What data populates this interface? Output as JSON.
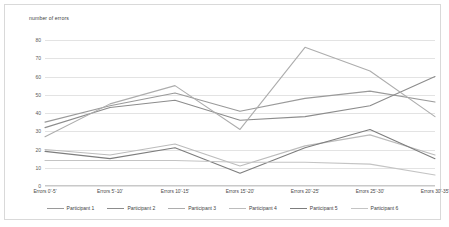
{
  "chart_data": {
    "type": "line",
    "title": "",
    "axis_title": "number of errors",
    "xlabel": "",
    "ylabel": "number of errors",
    "ylim": [
      0,
      80
    ],
    "yticks": [
      0,
      10,
      20,
      30,
      40,
      50,
      60,
      70,
      80
    ],
    "grid": true,
    "legend_position": "bottom",
    "categories": [
      "Errors 0'-5'",
      "Errors 5'-10'",
      "Errors 10'-15'",
      "Errors 15'-20'",
      "Errors 20'-25'",
      "Errors 25'-30'",
      "Errors 30'-35'"
    ],
    "series": [
      {
        "name": "Participant 1",
        "color": "#9a9a9a",
        "values": [
          35,
          44,
          51,
          41,
          48,
          52,
          46
        ]
      },
      {
        "name": "Participant 2",
        "color": "#8c8c8c",
        "values": [
          32,
          43,
          47,
          36,
          38,
          44,
          60
        ]
      },
      {
        "name": "Participant 3",
        "color": "#adadad",
        "values": [
          27,
          45,
          55,
          31,
          76,
          63,
          38
        ]
      },
      {
        "name": "Participant 4",
        "color": "#bcbcbc",
        "values": [
          20,
          17,
          23,
          11,
          22,
          28,
          17
        ]
      },
      {
        "name": "Participant 5",
        "color": "#7d7d7d",
        "values": [
          19,
          15,
          21,
          7,
          21,
          31,
          15
        ]
      },
      {
        "name": "Participant 6",
        "color": "#c4c4c4",
        "values": [
          14,
          14,
          14,
          13,
          13,
          12,
          6
        ]
      }
    ]
  }
}
